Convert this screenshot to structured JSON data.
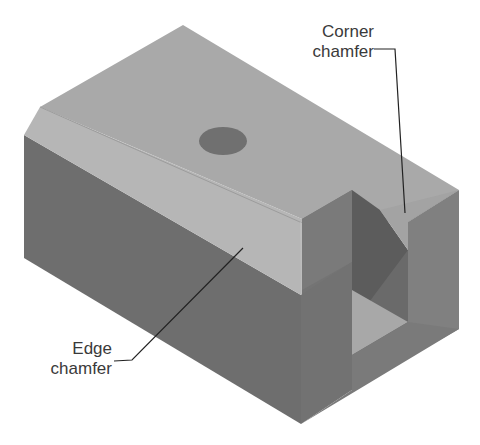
{
  "figure": {
    "colors": {
      "background": "#ffffff",
      "top_face": "#a9a9a9",
      "chamfer_face": "#b4b4b4",
      "front_face": "#6e6e6e",
      "right_face": "#808080",
      "slot_dark": "#5c5c5c",
      "slot_floor": "#a6a6a6",
      "hole": "#707070",
      "leader_line": "#222222",
      "text": "#3a3a3a"
    },
    "hole": {
      "cx": 223,
      "cy": 141,
      "rx": 24,
      "ry": 14
    }
  },
  "annotations": {
    "corner_chamfer": {
      "line1": "Corner",
      "line2": "chamfer"
    },
    "edge_chamfer": {
      "line1": "Edge",
      "line2": "chamfer"
    }
  }
}
